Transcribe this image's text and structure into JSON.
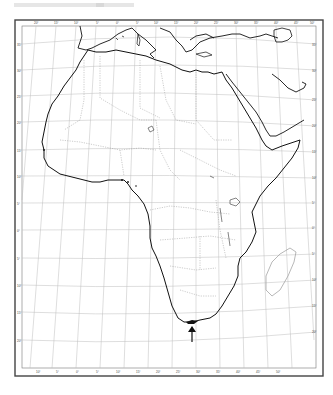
{
  "map": {
    "subject": "Outline map of Africa",
    "projection": "Conic graticule",
    "marker": {
      "type": "arrow",
      "target": "southern tip of Africa (Cape Agulhas)",
      "direction": "up"
    },
    "top_longitude_labels": [
      "20°",
      "15°",
      "10°",
      "5°",
      "0°",
      "5°",
      "10°",
      "15°",
      "20°",
      "25°",
      "30°",
      "35°",
      "40°",
      "45°",
      "50°",
      "55°"
    ],
    "bottom_longitude_labels": [
      "10°",
      "5°",
      "0°",
      "5°",
      "10°",
      "15°",
      "20°",
      "25°",
      "30°",
      "35°",
      "40°",
      "45°",
      "50°"
    ],
    "left_latitude_labels": [
      "35°",
      "30°",
      "25°",
      "20°",
      "15°",
      "10°",
      "5°",
      "0°",
      "5°",
      "10°",
      "15°",
      "20°",
      "25°",
      "30°",
      "35°"
    ],
    "right_latitude_labels": [
      "35°",
      "30°",
      "25°",
      "20°",
      "15°",
      "10°",
      "5°",
      "0°",
      "5°",
      "10°",
      "15°",
      "20°",
      "25°",
      "30°",
      "35°"
    ],
    "colors": {
      "coast": "#111111",
      "graticule": "#b5b5b5",
      "border": "#555555",
      "frame": "#444444"
    }
  }
}
